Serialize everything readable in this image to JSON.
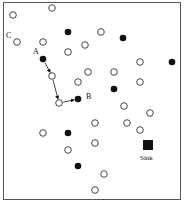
{
  "diagram": {
    "type": "sensor-network-routing",
    "labels": {
      "a": "A",
      "b": "B",
      "c": "C",
      "sink": "Sink"
    },
    "open_nodes": [
      [
        13,
        15
      ],
      [
        52,
        8
      ],
      [
        17,
        42
      ],
      [
        43,
        42
      ],
      [
        68,
        52
      ],
      [
        101,
        32
      ],
      [
        85,
        45
      ],
      [
        140,
        62
      ],
      [
        88,
        72
      ],
      [
        114,
        72
      ],
      [
        78,
        82
      ],
      [
        52,
        76
      ],
      [
        140,
        82
      ],
      [
        59,
        103
      ],
      [
        124,
        106
      ],
      [
        150,
        113
      ],
      [
        95,
        123
      ],
      [
        127,
        123
      ],
      [
        140,
        130
      ],
      [
        43,
        133
      ],
      [
        95,
        143
      ],
      [
        68,
        150
      ],
      [
        104,
        174
      ],
      [
        95,
        190
      ]
    ],
    "filled_nodes": [
      [
        68,
        32
      ],
      [
        123,
        38
      ],
      [
        43,
        59
      ],
      [
        172,
        62
      ],
      [
        114,
        89
      ],
      [
        78,
        99
      ],
      [
        68,
        133
      ],
      [
        78,
        166
      ]
    ],
    "path": [
      [
        43,
        59
      ],
      [
        52,
        76
      ],
      [
        59,
        103
      ],
      [
        78,
        99
      ]
    ],
    "sink": [
      148,
      145
    ],
    "colors": {
      "node_fill": "#111111",
      "node_stroke": "#333333",
      "border": "#555555"
    }
  }
}
